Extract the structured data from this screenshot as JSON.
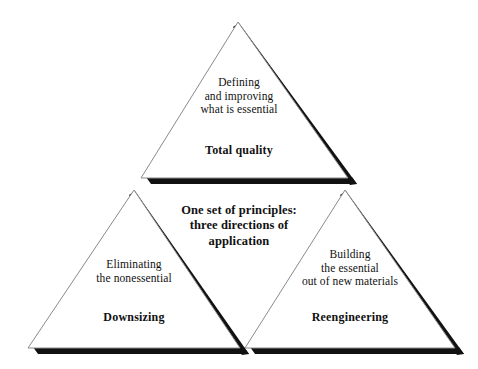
{
  "diagram": {
    "type": "triangle-pyramid-concept-diagram",
    "background_color": "#ffffff",
    "line_color": "#8a8a8a",
    "shadow_color": "#111111",
    "center_caption": {
      "lines": [
        "One set of principles:",
        "three directions of",
        "application"
      ]
    },
    "triangles": [
      {
        "id": "top",
        "position": "top",
        "title": "Total quality",
        "body_lines": [
          "Defining",
          "and improving",
          "what is essential"
        ]
      },
      {
        "id": "left",
        "position": "bottom-left",
        "title": "Downsizing",
        "body_lines": [
          "Eliminating",
          "the nonessential"
        ]
      },
      {
        "id": "right",
        "position": "bottom-right",
        "title": "Reengineering",
        "body_lines": [
          "Building",
          "the essential",
          "out of new materials"
        ]
      }
    ]
  }
}
